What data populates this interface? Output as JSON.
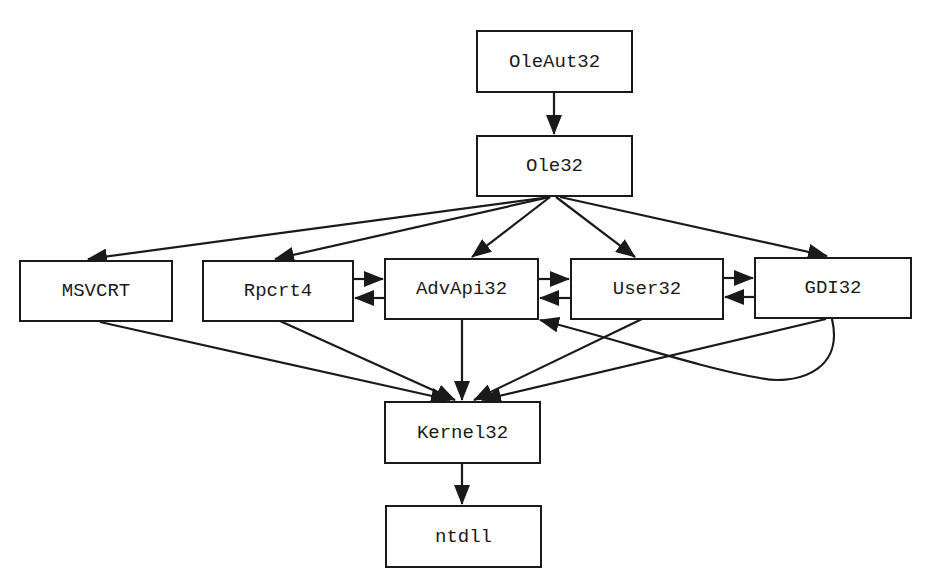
{
  "diagram": {
    "type": "dependency-graph",
    "nodes": [
      {
        "id": "oleaut32",
        "label": "OleAut32",
        "x": 476,
        "y": 30,
        "w": 157,
        "h": 63
      },
      {
        "id": "ole32",
        "label": "Ole32",
        "x": 476,
        "y": 135,
        "w": 157,
        "h": 62
      },
      {
        "id": "msvcrt",
        "label": "MSVCRT",
        "x": 19,
        "y": 260,
        "w": 154,
        "h": 62
      },
      {
        "id": "rpcrt4",
        "label": "Rpcrt4",
        "x": 202,
        "y": 260,
        "w": 152,
        "h": 62
      },
      {
        "id": "advapi32",
        "label": "AdvApi32",
        "x": 384,
        "y": 258,
        "w": 155,
        "h": 62
      },
      {
        "id": "user32",
        "label": "User32",
        "x": 570,
        "y": 258,
        "w": 154,
        "h": 62
      },
      {
        "id": "gdi32",
        "label": "GDI32",
        "x": 754,
        "y": 257,
        "w": 158,
        "h": 62
      },
      {
        "id": "kernel32",
        "label": "Kernel32",
        "x": 384,
        "y": 401,
        "w": 157,
        "h": 63
      },
      {
        "id": "ntdll",
        "label": "ntdll",
        "x": 385,
        "y": 505,
        "w": 157,
        "h": 63
      }
    ],
    "edges": [
      {
        "from": "OleAut32",
        "to": "Ole32"
      },
      {
        "from": "Ole32",
        "to": "MSVCRT"
      },
      {
        "from": "Ole32",
        "to": "Rpcrt4"
      },
      {
        "from": "Ole32",
        "to": "AdvApi32"
      },
      {
        "from": "Ole32",
        "to": "User32"
      },
      {
        "from": "Ole32",
        "to": "GDI32"
      },
      {
        "from": "Rpcrt4",
        "to": "AdvApi32"
      },
      {
        "from": "AdvApi32",
        "to": "Rpcrt4"
      },
      {
        "from": "AdvApi32",
        "to": "User32"
      },
      {
        "from": "User32",
        "to": "AdvApi32"
      },
      {
        "from": "User32",
        "to": "GDI32"
      },
      {
        "from": "GDI32",
        "to": "User32"
      },
      {
        "from": "GDI32",
        "to": "AdvApi32",
        "curved": true
      },
      {
        "from": "MSVCRT",
        "to": "Kernel32"
      },
      {
        "from": "Rpcrt4",
        "to": "Kernel32"
      },
      {
        "from": "AdvApi32",
        "to": "Kernel32"
      },
      {
        "from": "User32",
        "to": "Kernel32"
      },
      {
        "from": "GDI32",
        "to": "Kernel32"
      },
      {
        "from": "Kernel32",
        "to": "ntdll"
      }
    ],
    "colors": {
      "stroke": "#1a1a1a",
      "background": "#ffffff"
    }
  }
}
